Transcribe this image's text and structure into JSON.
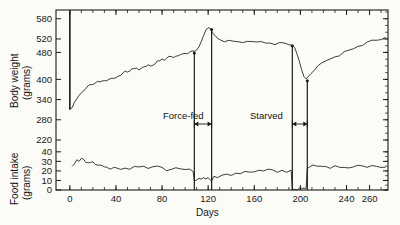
{
  "figure": {
    "background_color": "#fbfbf8",
    "ink_color": "#1a1a1a"
  },
  "axes": {
    "x_label": "Days",
    "x_ticks": [
      "0",
      "40",
      "80",
      "120",
      "160",
      "200",
      "240",
      "260"
    ],
    "y_top_label_line1": "Body weight",
    "y_top_label_line2": "(grams)",
    "y_top_ticks": [
      "580",
      "520",
      "480",
      "400",
      "340",
      "280",
      "220"
    ],
    "y_bottom_label_line1": "Food intake",
    "y_bottom_label_line2": "(grams)",
    "y_bottom_ticks": [
      "40",
      "30",
      "20",
      "10",
      "0"
    ]
  },
  "annotations": {
    "force_fed": "Force-fed",
    "starved": "Starved"
  },
  "chart_data": {
    "type": "line",
    "title": "",
    "xlabel": "Days",
    "xlim": [
      -12,
      276
    ],
    "grid": false,
    "legend": "none",
    "panels": [
      {
        "name": "body-weight",
        "ylabel": "Body weight (grams)",
        "ylim": [
          220,
          600
        ],
        "ytick_values": [
          580,
          520,
          480,
          400,
          340,
          280,
          220
        ],
        "units": "grams",
        "series": [
          {
            "name": "Body weight",
            "x": [
              0,
              2,
              4,
              6,
              8,
              10,
              12,
              14,
              16,
              18,
              20,
              22,
              24,
              26,
              28,
              30,
              32,
              34,
              36,
              38,
              40,
              42,
              44,
              46,
              48,
              50,
              52,
              54,
              56,
              58,
              60,
              62,
              64,
              66,
              68,
              70,
              72,
              74,
              76,
              78,
              80,
              82,
              84,
              86,
              88,
              90,
              92,
              94,
              96,
              98,
              100,
              102,
              104,
              106,
              108,
              110,
              112,
              114,
              116,
              118,
              120,
              122,
              124,
              126,
              128,
              130,
              134,
              138,
              142,
              146,
              150,
              154,
              158,
              162,
              166,
              170,
              174,
              178,
              182,
              186,
              190,
              193,
              195,
              197,
              199,
              201,
              203,
              205,
              207,
              209,
              212,
              215,
              218,
              222,
              226,
              230,
              234,
              238,
              242,
              246,
              250,
              254,
              258,
              262,
              266,
              270,
              274
            ],
            "y": [
              310,
              318,
              330,
              342,
              352,
              360,
              366,
              372,
              376,
              380,
              382,
              386,
              388,
              390,
              392,
              396,
              398,
              400,
              404,
              402,
              406,
              410,
              412,
              414,
              418,
              416,
              420,
              424,
              426,
              428,
              430,
              434,
              436,
              438,
              442,
              440,
              444,
              448,
              450,
              452,
              456,
              454,
              458,
              462,
              464,
              466,
              468,
              470,
              472,
              474,
              476,
              474,
              478,
              480,
              478,
              484,
              492,
              506,
              524,
              540,
              552,
              548,
              538,
              528,
              520,
              516,
              512,
              510,
              508,
              506,
              504,
              508,
              506,
              504,
              506,
              508,
              506,
              504,
              508,
              506,
              504,
              500,
              488,
              470,
              448,
              424,
              404,
              396,
              404,
              414,
              428,
              438,
              448,
              456,
              462,
              468,
              472,
              476,
              480,
              486,
              492,
              498,
              504,
              510,
              516,
              520,
              524
            ]
          }
        ]
      },
      {
        "name": "food-intake",
        "ylabel": "Food intake (grams)",
        "ylim": [
          0,
          44
        ],
        "ytick_values": [
          40,
          30,
          20,
          10,
          0
        ],
        "units": "grams",
        "series": [
          {
            "name": "Food intake",
            "x": [
              2,
              4,
              6,
              8,
              10,
              12,
              14,
              16,
              18,
              20,
              22,
              24,
              26,
              28,
              30,
              32,
              34,
              36,
              38,
              40,
              44,
              48,
              52,
              56,
              60,
              64,
              68,
              72,
              76,
              80,
              84,
              88,
              92,
              96,
              100,
              104,
              107,
              108,
              110,
              112,
              114,
              116,
              118,
              120,
              122,
              123,
              125,
              128,
              132,
              136,
              140,
              144,
              148,
              152,
              156,
              160,
              164,
              168,
              172,
              176,
              180,
              184,
              188,
              192,
              193,
              195,
              197,
              199,
              201,
              203,
              205,
              206,
              208,
              211,
              214,
              218,
              222,
              226,
              230,
              234,
              238,
              242,
              246,
              250,
              254,
              258,
              262,
              266,
              270,
              274
            ],
            "y": [
              24,
              28,
              31,
              30,
              33,
              32,
              29,
              28,
              27,
              28,
              26,
              25,
              24,
              25,
              23,
              24,
              23,
              22,
              24,
              23,
              22,
              23,
              22,
              23,
              22,
              23,
              21,
              22,
              23,
              22,
              21,
              22,
              23,
              22,
              21,
              22,
              20,
              10,
              9,
              11,
              10,
              12,
              10,
              11,
              9,
              10,
              14,
              13,
              15,
              16,
              15,
              17,
              16,
              18,
              17,
              18,
              19,
              18,
              20,
              19,
              18,
              20,
              19,
              20,
              0,
              0,
              0,
              0,
              0,
              0,
              0,
              21,
              22,
              24,
              23,
              25,
              24,
              23,
              25,
              23,
              24,
              23,
              22,
              24,
              23,
              22,
              24,
              23,
              22,
              23
            ]
          }
        ]
      }
    ],
    "interventions": [
      {
        "label": "Force-fed",
        "start_day": 108,
        "end_day": 123
      },
      {
        "label": "Starved",
        "start_day": 193,
        "end_day": 206
      }
    ],
    "markers": [
      {
        "name": "baseline-marker",
        "day": 0
      }
    ]
  }
}
